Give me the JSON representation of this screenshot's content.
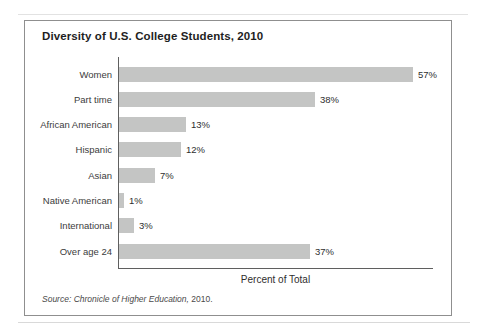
{
  "figure": {
    "title": "Diversity of U.S. College Students, 2010",
    "xlabel": "Percent of Total",
    "source_italic": "Source: Chronicle of Higher Education,",
    "source_roman": " 2010."
  },
  "chart_data": {
    "type": "bar",
    "orientation": "horizontal",
    "title": "Diversity of U.S. College Students, 2010",
    "xlabel": "Percent of Total",
    "ylabel": "",
    "categories": [
      "Women",
      "Part time",
      "African American",
      "Hispanic",
      "Asian",
      "Native American",
      "International",
      "Over age 24"
    ],
    "values": [
      57,
      38,
      13,
      12,
      7,
      1,
      3,
      37
    ],
    "value_labels": [
      "57%",
      "38%",
      "13%",
      "12%",
      "7%",
      "1%",
      "3%",
      "37%"
    ],
    "xlim": [
      0,
      61
    ],
    "grid": false,
    "legend": false,
    "bar_color": "#c4c5c4",
    "axis_color": "#5f5f5f",
    "source": "Source: Chronicle of Higher Education, 2010."
  }
}
